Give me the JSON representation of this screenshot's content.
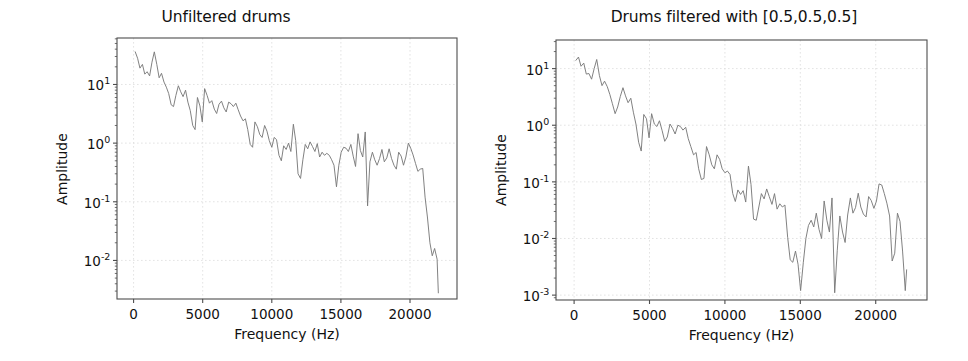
{
  "figure": {
    "width": 968,
    "height": 361,
    "background": "#ffffff",
    "line_color": "#7a7a7a",
    "grid_color": "#dcdcdc",
    "axis_color": "#4d4d4d",
    "text_color": "#111111"
  },
  "chart_data": [
    {
      "type": "line",
      "panel": "left",
      "title": "Unfiltered drums",
      "xlabel": "Frequency (Hz)",
      "ylabel": "Amplitude",
      "yscale": "log",
      "xscale": "linear",
      "grid": true,
      "legend": "none",
      "xlim": [
        -1200,
        23400
      ],
      "ylim": [
        0.0022,
        62
      ],
      "xticks": [
        0,
        5000,
        10000,
        15000,
        20000
      ],
      "xticklabels": [
        "0",
        "5000",
        "10000",
        "15000",
        "20000"
      ],
      "yticks": [
        10,
        1,
        0.1,
        0.01
      ],
      "yticklabels": [
        "10¹",
        "10⁰",
        "10⁻¹",
        "10⁻²"
      ],
      "ytick_mantissas": [
        "10",
        "10",
        "10",
        "10"
      ],
      "ytick_exponents": [
        "1",
        "0",
        "-1",
        "-2"
      ],
      "x": [
        120,
        290,
        460,
        640,
        810,
        980,
        1160,
        1330,
        1500,
        1680,
        1850,
        2020,
        2200,
        2370,
        2540,
        2720,
        2890,
        3060,
        3240,
        3410,
        3580,
        3760,
        3930,
        4100,
        4280,
        4450,
        4620,
        4800,
        4970,
        5140,
        5320,
        5490,
        5660,
        5840,
        6010,
        6180,
        6360,
        6530,
        6700,
        6880,
        7050,
        7220,
        7400,
        7570,
        7740,
        7920,
        8090,
        8260,
        8440,
        8610,
        8780,
        8960,
        9130,
        9300,
        9480,
        9650,
        9820,
        10000,
        10170,
        10340,
        10520,
        10690,
        10860,
        11040,
        11210,
        11380,
        11560,
        11730,
        11900,
        12080,
        12250,
        12420,
        12600,
        12770,
        12940,
        13120,
        13290,
        13460,
        13640,
        13810,
        13980,
        14160,
        14330,
        14500,
        14680,
        14850,
        15020,
        15200,
        15370,
        15540,
        15720,
        15890,
        16060,
        16240,
        16410,
        16580,
        16760,
        16930,
        17100,
        17280,
        17450,
        17620,
        17800,
        17970,
        18140,
        18320,
        18490,
        18660,
        18840,
        19010,
        19180,
        19360,
        19530,
        19700,
        19880,
        20050,
        20220,
        20400,
        20570,
        20740,
        20920,
        21090,
        21260,
        21440,
        21610,
        21780,
        21960,
        22050
      ],
      "y": [
        36.0,
        28.0,
        19.0,
        22.0,
        15.0,
        16.5,
        14.0,
        24.0,
        36.0,
        22.0,
        13.0,
        15.5,
        11.0,
        9.0,
        7.0,
        4.5,
        4.2,
        6.5,
        9.5,
        7.5,
        6.2,
        8.0,
        5.0,
        3.6,
        2.0,
        1.7,
        6.0,
        4.3,
        2.3,
        8.5,
        6.5,
        4.8,
        5.3,
        3.8,
        3.2,
        4.6,
        5.2,
        4.0,
        3.4,
        5.0,
        4.7,
        4.2,
        4.8,
        3.7,
        2.9,
        2.4,
        2.6,
        1.7,
        0.95,
        0.85,
        2.3,
        1.9,
        1.4,
        1.25,
        2.0,
        1.6,
        1.1,
        0.85,
        1.25,
        1.15,
        0.62,
        0.5,
        0.9,
        0.78,
        1.0,
        0.72,
        2.1,
        1.1,
        0.3,
        0.25,
        0.52,
        0.95,
        0.8,
        1.05,
        0.88,
        0.72,
        0.98,
        0.58,
        0.7,
        0.62,
        0.67,
        0.62,
        0.52,
        0.42,
        0.18,
        0.42,
        0.7,
        0.85,
        0.82,
        0.72,
        0.95,
        0.6,
        0.4,
        1.45,
        0.75,
        0.58,
        1.55,
        0.085,
        0.48,
        0.7,
        0.52,
        0.42,
        0.55,
        0.78,
        0.48,
        0.56,
        0.8,
        0.55,
        0.42,
        0.36,
        0.7,
        0.6,
        0.42,
        0.58,
        1.0,
        0.82,
        0.63,
        0.45,
        0.33,
        0.36,
        0.37,
        0.12,
        0.055,
        0.02,
        0.012,
        0.016,
        0.0105,
        0.0028,
        0.014
      ]
    },
    {
      "type": "line",
      "panel": "right",
      "title": "Drums filtered with [0.5,0.5,0.5]",
      "xlabel": "Frequency (Hz)",
      "ylabel": "Amplitude",
      "yscale": "log",
      "xscale": "linear",
      "grid": true,
      "legend": "none",
      "xlim": [
        -1200,
        23400
      ],
      "ylim": [
        0.00082,
        32
      ],
      "xticks": [
        0,
        5000,
        10000,
        15000,
        20000
      ],
      "xticklabels": [
        "0",
        "5000",
        "10000",
        "15000",
        "20000"
      ],
      "yticks": [
        10,
        1,
        0.1,
        0.01,
        0.001
      ],
      "yticklabels": [
        "10¹",
        "10⁰",
        "10⁻¹",
        "10⁻²",
        "10⁻³"
      ],
      "ytick_mantissas": [
        "10",
        "10",
        "10",
        "10",
        "10"
      ],
      "ytick_exponents": [
        "1",
        "0",
        "-1",
        "-2",
        "-3"
      ],
      "x": [
        120,
        290,
        460,
        640,
        810,
        980,
        1160,
        1330,
        1500,
        1680,
        1850,
        2020,
        2200,
        2370,
        2540,
        2720,
        2890,
        3060,
        3240,
        3410,
        3580,
        3760,
        3930,
        4100,
        4280,
        4450,
        4620,
        4800,
        4970,
        5140,
        5320,
        5490,
        5660,
        5840,
        6010,
        6180,
        6360,
        6530,
        6700,
        6880,
        7050,
        7220,
        7400,
        7570,
        7740,
        7920,
        8090,
        8260,
        8440,
        8610,
        8780,
        8960,
        9130,
        9300,
        9480,
        9650,
        9820,
        10000,
        10170,
        10340,
        10520,
        10690,
        10860,
        11040,
        11210,
        11380,
        11560,
        11730,
        11900,
        12080,
        12250,
        12420,
        12600,
        12770,
        12940,
        13120,
        13290,
        13460,
        13640,
        13810,
        13980,
        14160,
        14330,
        14500,
        14680,
        14850,
        15020,
        15200,
        15370,
        15540,
        15720,
        15890,
        16060,
        16240,
        16410,
        16580,
        16760,
        16930,
        17100,
        17280,
        17450,
        17620,
        17800,
        17970,
        18140,
        18320,
        18490,
        18660,
        18840,
        19010,
        19180,
        19360,
        19530,
        19700,
        19880,
        20050,
        20220,
        20400,
        20570,
        20740,
        20920,
        21090,
        21260,
        21440,
        21610,
        21780,
        21960,
        22050
      ],
      "y": [
        14.0,
        16.0,
        11.0,
        12.5,
        8.0,
        8.2,
        6.5,
        10.0,
        14.5,
        7.5,
        5.0,
        6.0,
        4.8,
        3.5,
        2.4,
        1.6,
        2.1,
        3.2,
        4.6,
        3.3,
        2.5,
        3.0,
        1.7,
        1.05,
        0.5,
        0.35,
        1.55,
        1.3,
        0.6,
        1.6,
        1.05,
        0.95,
        1.2,
        0.8,
        0.52,
        0.62,
        1.05,
        0.88,
        0.7,
        1.0,
        0.95,
        0.82,
        0.92,
        0.58,
        0.42,
        0.3,
        0.33,
        0.17,
        0.11,
        0.115,
        0.42,
        0.3,
        0.2,
        0.17,
        0.3,
        0.25,
        0.17,
        0.145,
        0.155,
        0.135,
        0.062,
        0.045,
        0.072,
        0.06,
        0.07,
        0.044,
        0.19,
        0.09,
        0.022,
        0.021,
        0.036,
        0.062,
        0.05,
        0.075,
        0.055,
        0.04,
        0.062,
        0.033,
        0.041,
        0.036,
        0.039,
        0.0105,
        0.0042,
        0.0038,
        0.006,
        0.0035,
        0.0012,
        0.0038,
        0.01,
        0.017,
        0.021,
        0.016,
        0.028,
        0.0145,
        0.01,
        0.046,
        0.021,
        0.013,
        0.052,
        0.0011,
        0.0062,
        0.025,
        0.013,
        0.0085,
        0.026,
        0.052,
        0.028,
        0.035,
        0.063,
        0.036,
        0.027,
        0.024,
        0.055,
        0.047,
        0.034,
        0.046,
        0.092,
        0.088,
        0.062,
        0.042,
        0.025,
        0.004,
        0.0055,
        0.028,
        0.02,
        0.006,
        0.0012,
        0.0028
      ]
    }
  ]
}
